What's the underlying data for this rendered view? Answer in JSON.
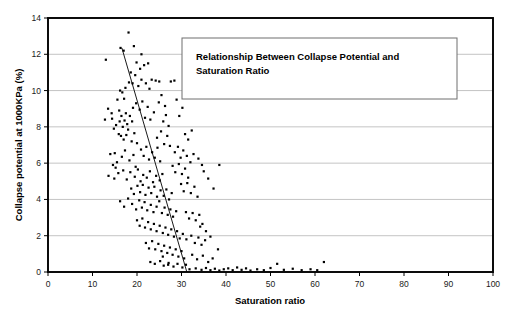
{
  "chart_data": {
    "type": "scatter",
    "title": "",
    "annotation_title_line1": "Relationship Between Collapse Potential and",
    "annotation_title_line2": "Saturation Ratio",
    "xlabel": "Saturation ratio",
    "ylabel": "Collapse potential at 1000KPa (%)",
    "xlim": [
      0,
      100
    ],
    "ylim": [
      0,
      14
    ],
    "xticks": [
      0,
      10,
      20,
      30,
      40,
      50,
      60,
      70,
      80,
      90,
      100
    ],
    "yticks": [
      0,
      2,
      4,
      6,
      8,
      10,
      12,
      14
    ],
    "xtick_labels": [
      "0",
      "10",
      "20",
      "30",
      "40",
      "50",
      "60",
      "70",
      "80",
      "90",
      "100"
    ],
    "ytick_labels": [
      "0",
      "2",
      "4",
      "6",
      "8",
      "10",
      "12",
      "14"
    ],
    "grid": "horizontal",
    "grid_color": "#a9a9a9",
    "legend": "none",
    "marker": "filled-square",
    "marker_color": "#000000",
    "marker_size": 2.2,
    "trendline": {
      "label": "linear regression",
      "color": "#000000",
      "x_start": 16.6,
      "y_start": 12.35,
      "x_end": 31.2,
      "y_end": 0.0
    },
    "points": [
      [
        13.0,
        11.7
      ],
      [
        14.3,
        8.75
      ],
      [
        14.4,
        8.45
      ],
      [
        15.0,
        6.55
      ],
      [
        15.2,
        5.75
      ],
      [
        16.3,
        12.35
      ],
      [
        17.0,
        12.2
      ],
      [
        18.1,
        13.2
      ],
      [
        19.3,
        12.45
      ],
      [
        16.2,
        10.0
      ],
      [
        16.7,
        9.9
      ],
      [
        17.4,
        10.15
      ],
      [
        17.1,
        9.55
      ],
      [
        15.6,
        9.5
      ],
      [
        16.0,
        8.9
      ],
      [
        16.5,
        8.6
      ],
      [
        17.5,
        8.75
      ],
      [
        18.2,
        10.45
      ],
      [
        18.6,
        11.0
      ],
      [
        19.0,
        10.4
      ],
      [
        19.6,
        10.85
      ],
      [
        20.3,
        10.25
      ],
      [
        21.0,
        10.6
      ],
      [
        22.0,
        10.4
      ],
      [
        23.3,
        10.6
      ],
      [
        20.7,
        11.2
      ],
      [
        21.6,
        11.4
      ],
      [
        19.9,
        11.55
      ],
      [
        14.8,
        7.9
      ],
      [
        15.3,
        8.1
      ],
      [
        16.1,
        8.3
      ],
      [
        16.8,
        8.0
      ],
      [
        17.2,
        8.35
      ],
      [
        17.8,
        8.15
      ],
      [
        18.4,
        8.6
      ],
      [
        18.9,
        8.3
      ],
      [
        15.9,
        7.6
      ],
      [
        16.4,
        7.5
      ],
      [
        17.0,
        7.3
      ],
      [
        17.6,
        7.55
      ],
      [
        18.0,
        7.85
      ],
      [
        18.8,
        7.2
      ],
      [
        19.4,
        7.65
      ],
      [
        20.0,
        7.1
      ],
      [
        19.1,
        9.05
      ],
      [
        19.8,
        9.3
      ],
      [
        20.6,
        8.95
      ],
      [
        21.2,
        9.4
      ],
      [
        21.8,
        8.5
      ],
      [
        22.4,
        9.1
      ],
      [
        23.0,
        8.4
      ],
      [
        23.8,
        8.8
      ],
      [
        22.8,
        10.1
      ],
      [
        24.2,
        10.55
      ],
      [
        25.0,
        10.5
      ],
      [
        20.9,
        6.75
      ],
      [
        21.5,
        6.4
      ],
      [
        22.1,
        6.9
      ],
      [
        22.7,
        6.2
      ],
      [
        23.4,
        6.6
      ],
      [
        24.0,
        6.3
      ],
      [
        24.6,
        6.85
      ],
      [
        25.2,
        6.1
      ],
      [
        14.0,
        6.5
      ],
      [
        14.6,
        5.9
      ],
      [
        15.5,
        6.05
      ],
      [
        16.6,
        6.35
      ],
      [
        17.3,
        6.7
      ],
      [
        18.3,
        6.15
      ],
      [
        19.2,
        6.45
      ],
      [
        19.7,
        5.8
      ],
      [
        13.6,
        5.3
      ],
      [
        14.9,
        5.15
      ],
      [
        15.8,
        5.45
      ],
      [
        16.9,
        5.6
      ],
      [
        17.7,
        5.1
      ],
      [
        18.5,
        5.5
      ],
      [
        19.5,
        5.25
      ],
      [
        20.2,
        5.65
      ],
      [
        20.8,
        5.0
      ],
      [
        21.4,
        5.35
      ],
      [
        22.2,
        5.2
      ],
      [
        22.9,
        5.55
      ],
      [
        23.6,
        4.95
      ],
      [
        24.3,
        5.3
      ],
      [
        25.1,
        5.05
      ],
      [
        25.7,
        5.4
      ],
      [
        18.7,
        4.6
      ],
      [
        19.3,
        4.3
      ],
      [
        20.1,
        4.75
      ],
      [
        20.7,
        4.4
      ],
      [
        21.3,
        4.8
      ],
      [
        21.9,
        4.25
      ],
      [
        22.6,
        4.65
      ],
      [
        23.2,
        4.35
      ],
      [
        23.9,
        4.7
      ],
      [
        24.5,
        4.15
      ],
      [
        25.3,
        4.5
      ],
      [
        26.0,
        4.2
      ],
      [
        26.6,
        4.55
      ],
      [
        27.2,
        4.0
      ],
      [
        27.8,
        4.35
      ],
      [
        16.2,
        3.9
      ],
      [
        17.1,
        3.6
      ],
      [
        18.0,
        4.05
      ],
      [
        18.9,
        3.75
      ],
      [
        19.8,
        3.45
      ],
      [
        20.5,
        3.95
      ],
      [
        21.1,
        3.55
      ],
      [
        21.7,
        3.85
      ],
      [
        22.3,
        3.4
      ],
      [
        23.1,
        3.7
      ],
      [
        23.7,
        3.3
      ],
      [
        24.4,
        3.6
      ],
      [
        25.0,
        3.9
      ],
      [
        25.6,
        3.25
      ],
      [
        26.2,
        3.55
      ],
      [
        26.9,
        3.15
      ],
      [
        27.5,
        3.45
      ],
      [
        28.1,
        3.05
      ],
      [
        28.8,
        3.35
      ],
      [
        20.0,
        2.85
      ],
      [
        20.6,
        2.55
      ],
      [
        21.2,
        2.95
      ],
      [
        21.8,
        2.45
      ],
      [
        22.5,
        2.75
      ],
      [
        23.1,
        2.35
      ],
      [
        23.8,
        2.65
      ],
      [
        24.4,
        2.25
      ],
      [
        25.1,
        2.55
      ],
      [
        25.8,
        2.15
      ],
      [
        26.4,
        2.45
      ],
      [
        27.0,
        2.05
      ],
      [
        27.7,
        2.35
      ],
      [
        28.3,
        1.95
      ],
      [
        29.0,
        2.25
      ],
      [
        29.6,
        1.85
      ],
      [
        22.0,
        1.6
      ],
      [
        22.7,
        1.3
      ],
      [
        23.4,
        1.7
      ],
      [
        24.1,
        1.25
      ],
      [
        24.8,
        1.55
      ],
      [
        25.5,
        1.15
      ],
      [
        26.1,
        1.45
      ],
      [
        26.8,
        1.05
      ],
      [
        27.4,
        1.35
      ],
      [
        28.0,
        0.95
      ],
      [
        28.7,
        1.25
      ],
      [
        29.3,
        0.85
      ],
      [
        30.0,
        1.15
      ],
      [
        30.6,
        0.75
      ],
      [
        23.0,
        0.55
      ],
      [
        24.0,
        0.45
      ],
      [
        25.2,
        0.6
      ],
      [
        26.0,
        0.35
      ],
      [
        27.1,
        0.5
      ],
      [
        28.2,
        0.3
      ],
      [
        29.1,
        0.45
      ],
      [
        30.2,
        0.25
      ],
      [
        31.0,
        0.4
      ],
      [
        31.8,
        0.15
      ],
      [
        24.5,
        7.4
      ],
      [
        25.4,
        7.75
      ],
      [
        26.1,
        7.05
      ],
      [
        26.8,
        7.5
      ],
      [
        27.4,
        6.95
      ],
      [
        25.9,
        8.3
      ],
      [
        26.5,
        8.65
      ],
      [
        27.1,
        8.05
      ],
      [
        24.9,
        9.35
      ],
      [
        25.5,
        9.75
      ],
      [
        26.3,
        9.15
      ],
      [
        28.5,
        6.6
      ],
      [
        29.2,
        6.9
      ],
      [
        29.8,
        6.3
      ],
      [
        30.4,
        6.7
      ],
      [
        28.0,
        5.85
      ],
      [
        28.6,
        5.5
      ],
      [
        29.4,
        5.95
      ],
      [
        30.1,
        5.4
      ],
      [
        30.8,
        5.7
      ],
      [
        31.5,
        5.2
      ],
      [
        31.2,
        6.4
      ],
      [
        32.0,
        6.05
      ],
      [
        32.7,
        6.5
      ],
      [
        29.9,
        4.85
      ],
      [
        30.5,
        4.45
      ],
      [
        31.3,
        4.9
      ],
      [
        32.1,
        4.35
      ],
      [
        32.9,
        4.7
      ],
      [
        33.6,
        4.15
      ],
      [
        31.0,
        3.3
      ],
      [
        31.7,
        2.95
      ],
      [
        32.5,
        3.25
      ],
      [
        33.2,
        2.85
      ],
      [
        34.0,
        3.15
      ],
      [
        34.7,
        2.65
      ],
      [
        30.3,
        2.1
      ],
      [
        31.1,
        1.8
      ],
      [
        32.2,
        2.0
      ],
      [
        33.0,
        1.6
      ],
      [
        33.8,
        1.9
      ],
      [
        34.5,
        1.5
      ],
      [
        35.3,
        1.75
      ],
      [
        32.4,
        0.95
      ],
      [
        33.5,
        0.7
      ],
      [
        34.8,
        0.9
      ],
      [
        36.0,
        0.55
      ],
      [
        37.0,
        0.75
      ],
      [
        38.2,
        1.25
      ],
      [
        33.2,
        0.2
      ],
      [
        34.5,
        0.12
      ],
      [
        35.5,
        0.22
      ],
      [
        36.5,
        0.1
      ],
      [
        37.5,
        0.18
      ],
      [
        38.5,
        0.08
      ],
      [
        39.5,
        0.15
      ],
      [
        40.5,
        0.2
      ],
      [
        41.5,
        0.1
      ],
      [
        42.5,
        0.25
      ],
      [
        43.5,
        0.12
      ],
      [
        44.5,
        0.2
      ],
      [
        45.5,
        0.08
      ],
      [
        47.0,
        0.15
      ],
      [
        48.5,
        0.1
      ],
      [
        50.0,
        0.22
      ],
      [
        51.5,
        0.45
      ],
      [
        53.0,
        0.12
      ],
      [
        55.0,
        0.18
      ],
      [
        57.0,
        0.1
      ],
      [
        59.0,
        0.15
      ],
      [
        62.0,
        0.55
      ],
      [
        60.5,
        0.1
      ],
      [
        25.8,
        0.85
      ],
      [
        27.0,
        0.4
      ],
      [
        35.5,
        2.25
      ],
      [
        36.5,
        1.95
      ],
      [
        34.2,
        2.5
      ],
      [
        36.0,
        5.15
      ],
      [
        37.2,
        4.6
      ],
      [
        35.0,
        5.55
      ],
      [
        33.8,
        6.25
      ],
      [
        34.6,
        5.9
      ],
      [
        29.5,
        8.6
      ],
      [
        30.2,
        9.05
      ],
      [
        28.9,
        9.5
      ],
      [
        31.5,
        7.3
      ],
      [
        32.3,
        7.8
      ],
      [
        30.8,
        7.6
      ],
      [
        38.5,
        5.9
      ],
      [
        27.6,
        10.5
      ],
      [
        28.4,
        10.55
      ],
      [
        21.0,
        12.0
      ],
      [
        22.5,
        11.5
      ],
      [
        13.5,
        9.0
      ],
      [
        12.8,
        8.4
      ]
    ]
  }
}
